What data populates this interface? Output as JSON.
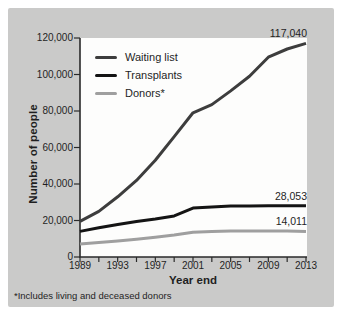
{
  "colors": {
    "background": "#cacac9",
    "plot_background": "#fdfdfc",
    "axis": "#2a2a2a",
    "text": "#1f1f1f"
  },
  "chart_data": {
    "type": "line",
    "title": "",
    "xlabel": "Year end",
    "ylabel": "Number of people",
    "footnote": "*Includes living and deceased donors",
    "xlim": [
      1989,
      2013
    ],
    "ylim": [
      0,
      120000
    ],
    "grid": false,
    "legend_position": "top-left",
    "x": [
      1989,
      1991,
      1993,
      1995,
      1997,
      1999,
      2001,
      2003,
      2005,
      2007,
      2009,
      2011,
      2013
    ],
    "x_ticks": [
      1989,
      1993,
      1997,
      2001,
      2005,
      2009,
      2013
    ],
    "x_tick_labels": [
      "1989",
      "1993",
      "1997",
      "2001",
      "2005",
      "2009",
      "2013"
    ],
    "y_ticks": [
      0,
      20000,
      40000,
      60000,
      80000,
      100000,
      120000
    ],
    "y_tick_labels": [
      "0",
      "20,000",
      "40,000",
      "60,000",
      "80,000",
      "100,000",
      "120,000"
    ],
    "series": [
      {
        "name": "Waiting list",
        "color": "#3d3d3d",
        "end_label": "117,040",
        "values": [
          19500,
          25000,
          33000,
          42000,
          53000,
          66000,
          79000,
          83500,
          91000,
          99000,
          109500,
          114000,
          117040
        ]
      },
      {
        "name": "Transplants",
        "color": "#141414",
        "end_label": "28,053",
        "values": [
          14000,
          16000,
          17800,
          19400,
          20800,
          22500,
          26800,
          27400,
          27900,
          28000,
          28100,
          28100,
          28053
        ]
      },
      {
        "name": "Donors*",
        "color": "#9f9f9f",
        "end_label": "14,011",
        "values": [
          7200,
          8000,
          8800,
          9700,
          10800,
          12000,
          13600,
          14000,
          14200,
          14300,
          14300,
          14200,
          14011
        ]
      }
    ]
  }
}
